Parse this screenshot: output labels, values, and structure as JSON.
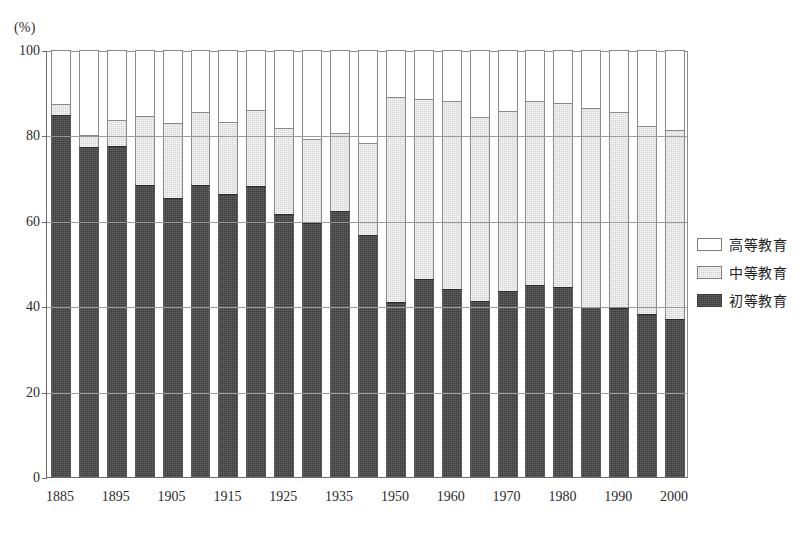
{
  "axis_unit_label": "(%)",
  "legend": {
    "position": "right",
    "items": [
      {
        "key": "higher",
        "label": "高等教育",
        "color": "#ffffff"
      },
      {
        "key": "secondary",
        "label": "中等教育",
        "color": "#d3d3d3"
      },
      {
        "key": "primary",
        "label": "初等教育",
        "color": "#3c3c3c"
      }
    ]
  },
  "chart_data": {
    "type": "bar",
    "title": "",
    "subtitle": "",
    "xlabel": "",
    "ylabel": "",
    "unit": "(%)",
    "stacked": true,
    "grid": true,
    "ylim": [
      0,
      100
    ],
    "yticks": [
      0,
      20,
      40,
      60,
      80,
      100
    ],
    "ytick_labels": [
      "0",
      "20",
      "40",
      "60",
      "80",
      "100"
    ],
    "categories": [
      "1885",
      "1890",
      "1895",
      "1900",
      "1905",
      "1910",
      "1915",
      "1920",
      "1925",
      "1930",
      "1935",
      "1940",
      "1950",
      "1955",
      "1960",
      "1965",
      "1970",
      "1975",
      "1980",
      "1985",
      "1990",
      "1995",
      "2000"
    ],
    "xtick_labels": [
      "1885",
      "1895",
      "1905",
      "1915",
      "1925",
      "1935",
      "1950",
      "1960",
      "1970",
      "1980",
      "1990",
      "2000"
    ],
    "xtick_categories": [
      "1885",
      "1895",
      "1905",
      "1915",
      "1925",
      "1935",
      "1950",
      "1960",
      "1970",
      "1980",
      "1990",
      "2000"
    ],
    "series": [
      {
        "name": "初等教育",
        "key": "primary",
        "color": "#3c3c3c",
        "values": [
          84.8,
          77.4,
          77.5,
          68.3,
          65.3,
          68.5,
          66.3,
          68.2,
          61.6,
          59.6,
          62.3,
          56.7,
          41.0,
          46.4,
          44.0,
          41.2,
          43.6,
          45.0,
          44.6,
          39.9,
          39.5,
          38.1,
          36.9
        ]
      },
      {
        "name": "中等教育",
        "key": "secondary",
        "color": "#d3d3d3",
        "values": [
          2.6,
          2.6,
          6.0,
          16.3,
          17.6,
          17.0,
          16.8,
          17.7,
          20.2,
          19.5,
          18.3,
          21.5,
          47.9,
          42.2,
          44.0,
          43.2,
          42.2,
          43.0,
          43.1,
          46.5,
          46.1,
          44.0,
          44.4
        ]
      },
      {
        "name": "高等教育",
        "key": "higher",
        "color": "#ffffff",
        "values": [
          12.6,
          20.0,
          16.5,
          15.4,
          17.1,
          14.5,
          16.9,
          14.1,
          18.2,
          20.9,
          19.4,
          21.8,
          11.1,
          11.4,
          12.0,
          15.6,
          14.2,
          12.0,
          12.3,
          13.6,
          14.4,
          17.9,
          18.7
        ]
      }
    ]
  }
}
